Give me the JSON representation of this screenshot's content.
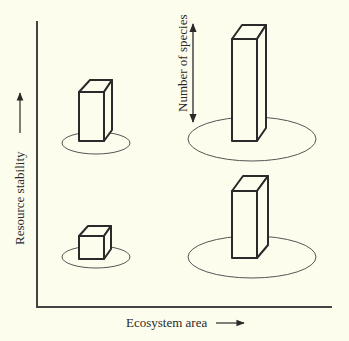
{
  "diagram": {
    "x_axis_label": "Ecosystem area",
    "y_axis_label": "Resource stability",
    "annotation_label": "Number of species",
    "colors": {
      "background": "#fdfdee",
      "stroke": "#2a2a2a",
      "box_fill": "#fdfdee"
    },
    "quadrants": [
      {
        "position": "top-left",
        "ecosystem_area": "small",
        "resource_stability": "high",
        "species_bar": "medium"
      },
      {
        "position": "bottom-left",
        "ecosystem_area": "small",
        "resource_stability": "low",
        "species_bar": "small"
      },
      {
        "position": "top-right",
        "ecosystem_area": "large",
        "resource_stability": "high",
        "species_bar": "tallest"
      },
      {
        "position": "bottom-right",
        "ecosystem_area": "large",
        "resource_stability": "low",
        "species_bar": "tall"
      }
    ]
  }
}
